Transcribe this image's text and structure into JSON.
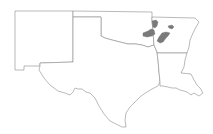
{
  "map": {
    "title": "",
    "background": "#ffffff",
    "state_outline_color": "#8c8c8c",
    "highlight_color": "#7a7a7a",
    "states": [
      {
        "name": "New Mexico",
        "id": "NM"
      },
      {
        "name": "Oklahoma",
        "id": "OK"
      },
      {
        "name": "Texas",
        "id": "TX"
      },
      {
        "name": "Arkansas",
        "id": "AR"
      },
      {
        "name": "Louisiana",
        "id": "LA"
      }
    ],
    "highlighted_regions": [
      {
        "state": "AR",
        "location": "northwest Arkansas"
      },
      {
        "state": "AR",
        "location": "west-central Arkansas (Arkansas River valley)"
      },
      {
        "state": "AR",
        "location": "central Arkansas"
      },
      {
        "state": "AR",
        "location": "north-central Arkansas"
      }
    ]
  }
}
